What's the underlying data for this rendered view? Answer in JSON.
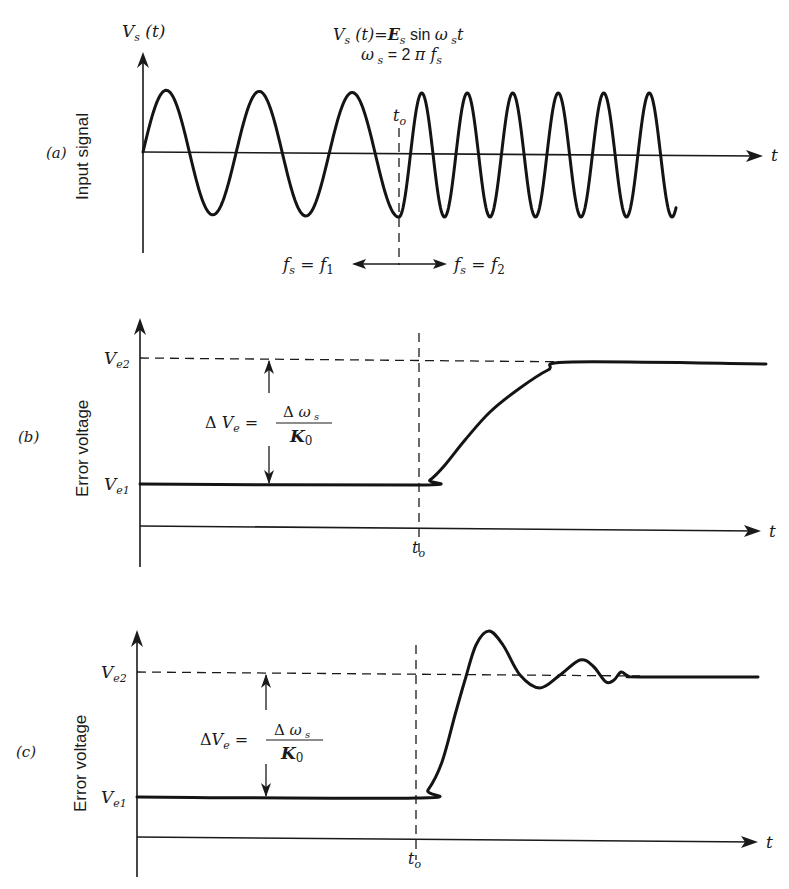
{
  "figure": {
    "panels": [
      {
        "id": "a",
        "tag": "(a)",
        "ylabel": "Input signal",
        "y_axis_label": {
          "main": "V",
          "sub": "s",
          "rest": " (t)"
        },
        "equation_line1": {
          "V": "V",
          "Vs": "s",
          "t": " (t)=",
          "E": "E",
          "Es": "s",
          "sin": " sin ",
          "w": "ω",
          "ws": " s",
          "tt": "t"
        },
        "equation_line2": {
          "w": "ω",
          "ws": " s",
          "eq": " = 2 ",
          "pi": "π",
          "f": " f",
          "fs": "s"
        },
        "time_marker": {
          "main": "t",
          "sub": "o"
        },
        "x_axis_label": "t",
        "left_annotation": {
          "f": "f",
          "fs": "s",
          "eq": " = ",
          "f1": "f",
          "f1sub": "1"
        },
        "right_annotation": {
          "f": "f",
          "fs": "s",
          "eq": " = ",
          "f2": "f",
          "f2sub": "2"
        }
      },
      {
        "id": "b",
        "tag": "(b)",
        "ylabel": "Error voltage",
        "ve2": {
          "main": "V",
          "sub": "e2"
        },
        "ve1": {
          "main": "V",
          "sub": "e1"
        },
        "delta_label": {
          "delta": "Δ ",
          "V": "V",
          "Vsub": "e",
          "eq": " = ",
          "num_delta": "Δ ",
          "num_w": "ω",
          "num_sub": " s",
          "den_K": "K",
          "den_sub": "0"
        },
        "time_marker": {
          "main": "t",
          "sub": "o"
        },
        "x_axis_label": "t"
      },
      {
        "id": "c",
        "tag": "(c)",
        "ylabel": "Error voltage",
        "ve2": {
          "main": "V",
          "sub": "e2"
        },
        "ve1": {
          "main": "V",
          "sub": "e1"
        },
        "delta_label": {
          "delta": "Δ",
          "V": "V",
          "Vsub": "e",
          "eq": " = ",
          "num_delta": "Δ ",
          "num_w": "ω",
          "num_sub": " s",
          "den_K": "K",
          "den_sub": "0"
        },
        "time_marker": {
          "main": "t",
          "sub": "o"
        },
        "x_axis_label": "t"
      }
    ]
  },
  "chart_data": [
    {
      "type": "line",
      "title": "(a) Input signal",
      "xlabel": "t",
      "ylabel": "Input signal  V_s(t)",
      "equation": "V_s(t) = E_s sin ω_s t,  ω_s = 2π f_s",
      "segments": [
        {
          "label": "f_s = f_1",
          "x_start": 143,
          "x_end": 399,
          "period_px": 93,
          "amplitude_px": 62,
          "start_phase": "zero-rising",
          "end_phase": "trough"
        },
        {
          "label": "f_s = f_2",
          "x_start": 399,
          "x_end": 676,
          "period_px": 45.5,
          "amplitude_px": 62,
          "start_phase": "trough"
        }
      ],
      "baseline_y": 152,
      "t_o_x": 399,
      "annotations": [
        "t_o",
        "f_s = f_1",
        "f_s = f_2"
      ]
    },
    {
      "type": "line",
      "title": "(b) Error voltage — overdamped response",
      "xlabel": "t",
      "ylabel": "Error voltage",
      "levels": {
        "V_e1": 484,
        "V_e2": 361
      },
      "t_o_x": 419,
      "points": [
        [
          140,
          484
        ],
        [
          417,
          485
        ],
        [
          430,
          480
        ],
        [
          445,
          465
        ],
        [
          465,
          440
        ],
        [
          490,
          412
        ],
        [
          520,
          388
        ],
        [
          548,
          370
        ],
        [
          572,
          362
        ],
        [
          766,
          364
        ]
      ],
      "annotations": [
        "ΔV_e = Δω_s / K_0",
        "t_o",
        "V_e1",
        "V_e2"
      ]
    },
    {
      "type": "line",
      "title": "(c) Error voltage — underdamped (oscillatory) response",
      "xlabel": "t",
      "ylabel": "Error voltage",
      "levels": {
        "V_e1": 797,
        "V_e2": 674
      },
      "t_o_x": 416,
      "points": [
        [
          137,
          797
        ],
        [
          416,
          798
        ],
        [
          428,
          790
        ],
        [
          442,
          762
        ],
        [
          455,
          715
        ],
        [
          465,
          680
        ],
        [
          476,
          645
        ],
        [
          489,
          631
        ],
        [
          503,
          645
        ],
        [
          520,
          675
        ],
        [
          540,
          688
        ],
        [
          560,
          675
        ],
        [
          580,
          660
        ],
        [
          593,
          666
        ],
        [
          606,
          682
        ],
        [
          614,
          680
        ],
        [
          621,
          672
        ],
        [
          628,
          676
        ],
        [
          640,
          677
        ],
        [
          758,
          677
        ]
      ],
      "annotations": [
        "ΔV_e = Δω_s / K_0",
        "t_o",
        "V_e1",
        "V_e2"
      ]
    }
  ]
}
